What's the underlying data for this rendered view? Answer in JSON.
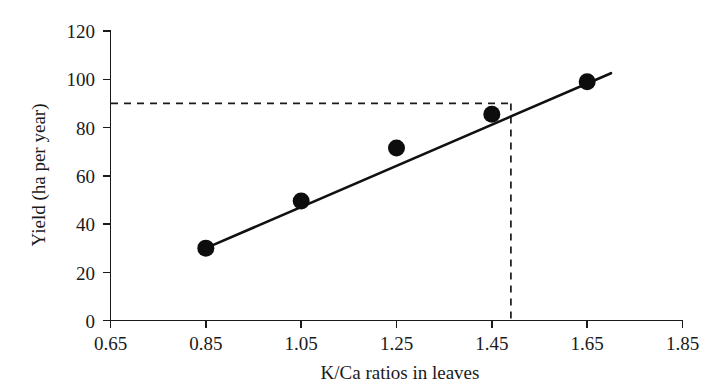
{
  "chart_data": {
    "type": "scatter",
    "title": "",
    "xlabel": "K/Ca ratios in leaves",
    "ylabel": "Yield (ha per year)",
    "xlim": [
      0.65,
      1.85
    ],
    "ylim": [
      0,
      120
    ],
    "xticks": [
      "0.65",
      "0.85",
      "1.05",
      "1.25",
      "1.45",
      "1.65",
      "1.85"
    ],
    "yticks": [
      "0",
      "20",
      "40",
      "60",
      "80",
      "100",
      "120"
    ],
    "xtick_values": [
      0.65,
      0.85,
      1.05,
      1.25,
      1.45,
      1.65,
      1.85
    ],
    "ytick_values": [
      0,
      20,
      40,
      60,
      80,
      100,
      120
    ],
    "grid": false,
    "legend": "none",
    "x": [
      0.85,
      1.05,
      1.25,
      1.45,
      1.65
    ],
    "y": [
      30,
      49.5,
      71.5,
      85.5,
      99
    ],
    "points": [
      {
        "x": 0.85,
        "y": 30
      },
      {
        "x": 1.05,
        "y": 49.5
      },
      {
        "x": 1.25,
        "y": 71.5
      },
      {
        "x": 1.45,
        "y": 85.5
      },
      {
        "x": 1.65,
        "y": 99
      }
    ],
    "series": [
      {
        "name": "Yield vs K/Ca ratio",
        "marker": "filled-circle",
        "values": [
          30,
          49.5,
          71.5,
          85.5,
          99
        ]
      }
    ],
    "trend_line": {
      "type": "linear-fit",
      "x_start": 0.85,
      "y_start": 30,
      "x_end": 1.7,
      "y_end": 102.5
    },
    "reference_lines": [
      {
        "name": "horizontal-reference",
        "orientation": "horizontal",
        "value": 90,
        "style": "dashed",
        "x_from": 0.65,
        "x_to": 1.49
      },
      {
        "name": "vertical-reference",
        "orientation": "vertical",
        "value": 1.49,
        "style": "dashed",
        "y_from": 0,
        "y_to": 90
      }
    ],
    "colors": {
      "axis": "#1a1a1a",
      "marker": "#0d0d0d",
      "trend": "#111111",
      "reference": "#1a1a1a",
      "background": "#ffffff"
    }
  }
}
